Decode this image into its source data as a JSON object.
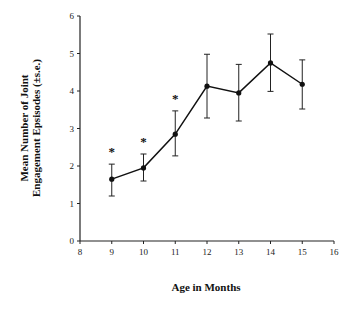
{
  "chart_data": {
    "type": "line",
    "title": "",
    "xlabel": "Age in Months",
    "ylabel_lines": [
      "Mean Number of Joint",
      "Engagement Epsisodes (±s.e.)"
    ],
    "ylabel": "Mean Number of Joint Engagement Epsisodes (±s.e.)",
    "xlim": [
      8,
      16
    ],
    "ylim": [
      0,
      6
    ],
    "x_ticks": [
      8,
      9,
      10,
      11,
      12,
      13,
      14,
      15,
      16
    ],
    "y_ticks": [
      0,
      1,
      2,
      3,
      4,
      5,
      6
    ],
    "grid": false,
    "legend": null,
    "series": [
      {
        "name": "Joint engagement episodes",
        "x": [
          9,
          10,
          11,
          12,
          13,
          14,
          15
        ],
        "values": [
          1.65,
          1.95,
          2.85,
          4.13,
          3.95,
          4.75,
          4.18
        ],
        "error_upper": [
          2.05,
          2.32,
          3.47,
          4.98,
          4.71,
          5.52,
          4.83
        ],
        "error_lower": [
          1.2,
          1.6,
          2.27,
          3.28,
          3.2,
          3.99,
          3.52
        ]
      }
    ],
    "annotations": [
      {
        "x": 9,
        "text": "*"
      },
      {
        "x": 10,
        "text": "*"
      },
      {
        "x": 11,
        "text": "*"
      }
    ]
  }
}
